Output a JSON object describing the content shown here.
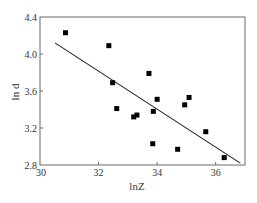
{
  "chart_data": {
    "type": "scatter",
    "title": "",
    "xlabel": "lnZ",
    "ylabel": "ln d",
    "xlim": [
      30,
      37
    ],
    "ylim": [
      2.8,
      4.4
    ],
    "xticks": [
      30,
      32,
      34,
      36
    ],
    "xtick_labels": [
      "30",
      "32",
      "34",
      "36"
    ],
    "yticks": [
      2.8,
      3.2,
      3.6,
      4.0,
      4.4
    ],
    "ytick_labels": [
      "2.8",
      "3.2",
      "3.6",
      "4.0",
      "4.4"
    ],
    "grid": false,
    "legend": null,
    "series": [
      {
        "name": "data",
        "marker": "square",
        "color": "#000000",
        "points": [
          {
            "x": 30.87,
            "y": 4.23
          },
          {
            "x": 32.35,
            "y": 4.09
          },
          {
            "x": 32.48,
            "y": 3.69
          },
          {
            "x": 32.62,
            "y": 3.41
          },
          {
            "x": 33.2,
            "y": 3.32
          },
          {
            "x": 33.31,
            "y": 3.34
          },
          {
            "x": 33.72,
            "y": 3.79
          },
          {
            "x": 33.85,
            "y": 3.03
          },
          {
            "x": 33.87,
            "y": 3.38
          },
          {
            "x": 34.0,
            "y": 3.51
          },
          {
            "x": 34.7,
            "y": 2.97
          },
          {
            "x": 34.94,
            "y": 3.45
          },
          {
            "x": 35.09,
            "y": 3.53
          },
          {
            "x": 35.66,
            "y": 3.16
          },
          {
            "x": 36.29,
            "y": 2.88
          }
        ]
      },
      {
        "name": "linear fit",
        "type": "line",
        "color": "#222222",
        "points": [
          {
            "x": 30.51,
            "y": 4.12
          },
          {
            "x": 36.84,
            "y": 2.82
          }
        ]
      }
    ]
  },
  "labels": {
    "xlabel": "lnZ",
    "ylabel": "ln d"
  }
}
